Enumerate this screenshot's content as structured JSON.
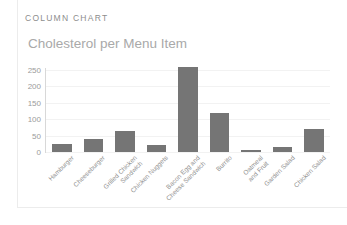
{
  "card": {
    "eyebrow": "COLUMN CHART"
  },
  "chart_data": {
    "type": "bar",
    "title": "Cholesterol per Menu Item",
    "xlabel": "",
    "ylabel": "",
    "categories": [
      "Hamburger",
      "Cheeseburger",
      "Grilled Chicken\nSandwich",
      "Chicken Nuggets",
      "Bacon Egg and\nCheese Sandwich",
      "Burrito",
      "Oatmeal\nand Fruit",
      "Garden Salad",
      "Chicken Salad"
    ],
    "values": [
      25,
      40,
      65,
      22,
      260,
      120,
      5,
      15,
      70
    ],
    "ylim": [
      0,
      250
    ],
    "yticks": [
      0,
      50,
      100,
      150,
      200,
      250
    ],
    "ytick_labels": [
      "0",
      "50",
      "100",
      "150",
      "200",
      "250"
    ],
    "grid": true,
    "legend": false,
    "bar_color": "#757575",
    "grid_color": "#f2f2f2",
    "axis_color": "#d8d8d8",
    "title_color": "#a9a9a9",
    "tick_color": "#9b9b9b"
  }
}
